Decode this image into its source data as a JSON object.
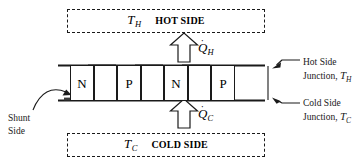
{
  "diagram": {
    "hot_reservoir": {
      "temp_symbol": "T",
      "temp_subscript": "H",
      "label": "HOT SIDE"
    },
    "cold_reservoir": {
      "temp_symbol": "T",
      "temp_subscript": "C",
      "label": "COLD SIDE"
    },
    "module": {
      "pillars": [
        {
          "label": "N",
          "type": "n-type"
        },
        {
          "label": "",
          "type": "blank"
        },
        {
          "label": "P",
          "type": "p-type"
        },
        {
          "label": "",
          "type": "blank"
        },
        {
          "label": "N",
          "type": "n-type"
        },
        {
          "label": "",
          "type": "blank"
        },
        {
          "label": "P",
          "type": "p-type"
        }
      ]
    },
    "heat_flux_hot": {
      "symbol": "Q",
      "dot": "˙",
      "subscript": "H",
      "direction": "up"
    },
    "heat_flux_cold": {
      "symbol": "Q",
      "dot": "˙",
      "subscript": "C",
      "direction": "up"
    },
    "annotations": {
      "hot_junction": {
        "line1": "Hot Side",
        "line2_text": "Junction, ",
        "line2_symbol": "T",
        "line2_subscript": "H"
      },
      "cold_junction": {
        "line1": "Cold Side",
        "line2_text": "Junction, ",
        "line2_symbol": "T",
        "line2_subscript": "C"
      },
      "shunt": {
        "line1": "Shunt",
        "line2": "Side"
      }
    },
    "colors": {
      "stroke": "#1a1a1a",
      "background": "#ffffff",
      "shunt_fill": "#3a3a3a"
    }
  }
}
